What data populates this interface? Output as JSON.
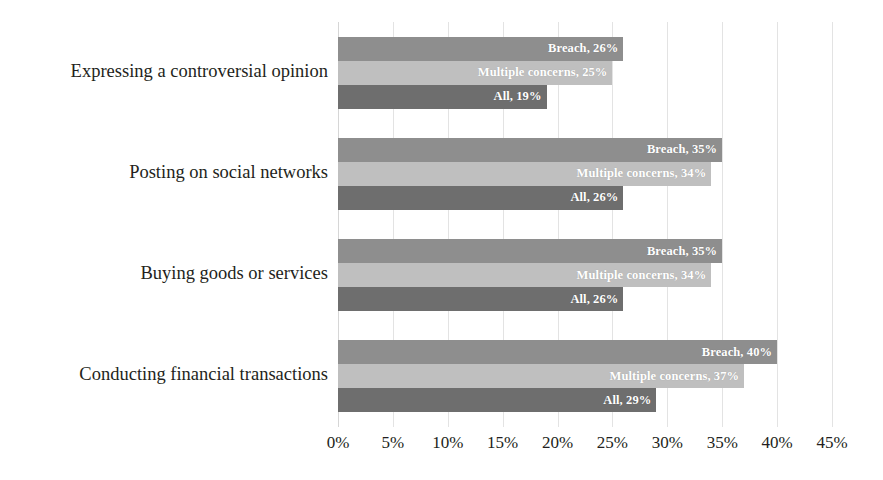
{
  "chart_data": {
    "type": "bar",
    "orientation": "horizontal",
    "title": "",
    "subtitle": "",
    "xlabel": "",
    "ylabel": "",
    "xlim": [
      0,
      45
    ],
    "xticks": [
      0,
      5,
      10,
      15,
      20,
      25,
      30,
      35,
      40,
      45
    ],
    "xtick_labels": [
      "0%",
      "5%",
      "10%",
      "15%",
      "20%",
      "25%",
      "30%",
      "35%",
      "40%",
      "45%"
    ],
    "grid": true,
    "legend": "none",
    "value_suffix": "%",
    "categories": [
      "Expressing a controversial opinion",
      "Posting on social networks",
      "Buying goods or services",
      "Conducting financial transactions"
    ],
    "series": [
      {
        "name": "Breach",
        "color": "#8e8e8e",
        "values": [
          26,
          35,
          35,
          40
        ],
        "labels": [
          "Breach, 26%",
          "Breach, 35%",
          "Breach, 35%",
          "Breach, 40%"
        ]
      },
      {
        "name": "Multiple concerns",
        "color": "#bfbfbf",
        "values": [
          25,
          34,
          34,
          37
        ],
        "labels": [
          "Multiple concerns, 25%",
          "Multiple concerns, 34%",
          "Multiple concerns, 34%",
          "Multiple concerns, 37%"
        ]
      },
      {
        "name": "All",
        "color": "#6e6e6e",
        "values": [
          19,
          26,
          26,
          29
        ],
        "labels": [
          "All, 19%",
          "All, 26%",
          "All, 26%",
          "All, 29%"
        ]
      }
    ],
    "colors": {
      "breach": "#8e8e8e",
      "multiple_concerns": "#bfbfbf",
      "all": "#6e6e6e",
      "gridline": "#e3e3e3",
      "text": "#231f20",
      "bar_label_text": "#ffffff",
      "background": "#ffffff"
    }
  }
}
